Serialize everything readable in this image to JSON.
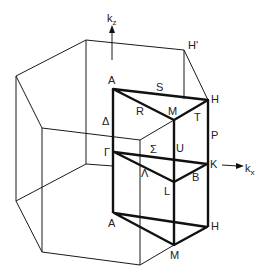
{
  "axes": {
    "kz": {
      "base": "k",
      "sub": "z"
    },
    "kx": {
      "base": "k",
      "sub": "x"
    }
  },
  "points": {
    "A_top": "A",
    "H_prime": "H'",
    "H_top": "H",
    "M_top": "M",
    "S": "S",
    "R": "R",
    "T": "T",
    "Delta": "Δ",
    "P": "P",
    "Gamma": "Γ",
    "Sigma": "Σ",
    "U": "U",
    "K": "K",
    "Lambda": "Λ",
    "L": "L",
    "B": "B",
    "A_bottom": "A",
    "H_bottom": "H",
    "M_bottom": "M"
  },
  "colors": {
    "line": "#111111",
    "background": "#ffffff"
  }
}
